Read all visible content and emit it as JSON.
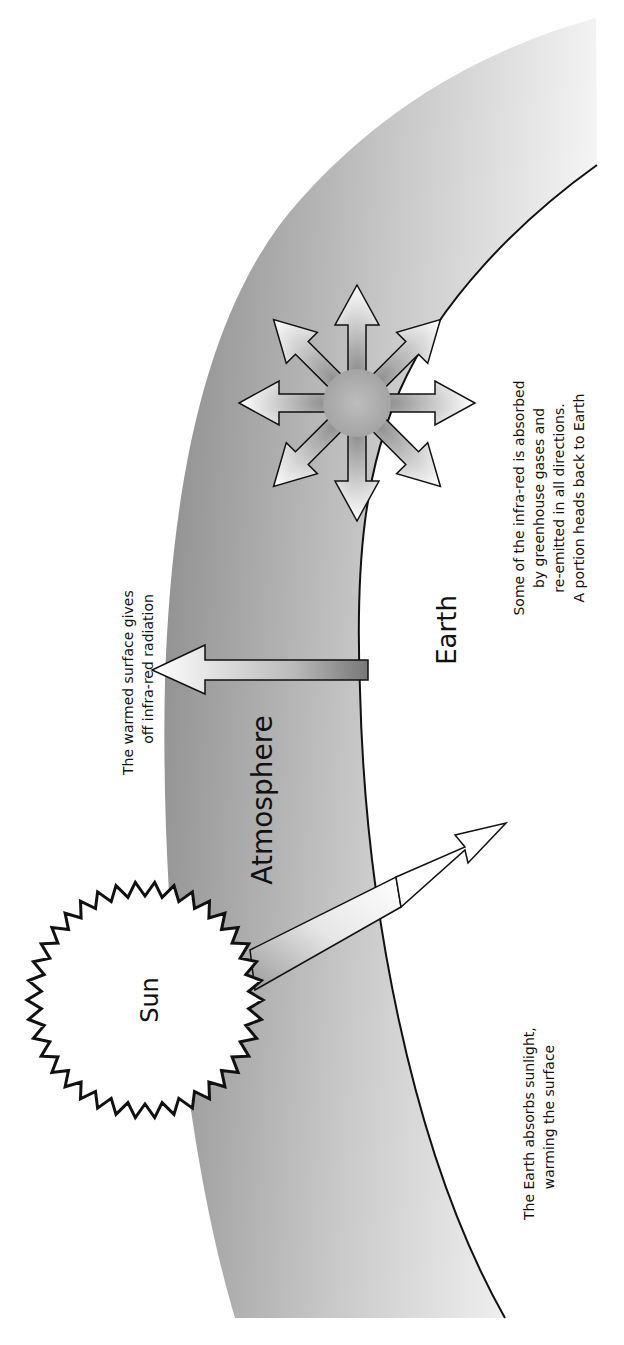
{
  "diagram": {
    "orientation": "rotated -90deg",
    "colors": {
      "background": "#ffffff",
      "outline": "#111111",
      "atmosphere_dark": "#8a8a8a",
      "atmosphere_light": "#f2f2f2",
      "sun_fill": "#ffffff"
    },
    "labels": {
      "sun": "Sun",
      "atmosphere": "Atmosphere",
      "earth": "Earth"
    },
    "annotations": {
      "sunlight": [
        "The Earth absorbs sunlight,",
        "warming the surface"
      ],
      "infrared": [
        "The warmed surface gives",
        "off infra-red radiation"
      ],
      "greenhouse": [
        "Some of the infra-red is absorbed",
        "by greenhouse gases and",
        "re-emitted in all directions.",
        "A portion heads back to Earth"
      ]
    },
    "icons": {
      "sun": "sun-icon",
      "sunlight_arrow": "arrow-icon",
      "infrared_arrow": "arrow-icon",
      "reemission_burst": "radiating-arrows-icon"
    }
  }
}
